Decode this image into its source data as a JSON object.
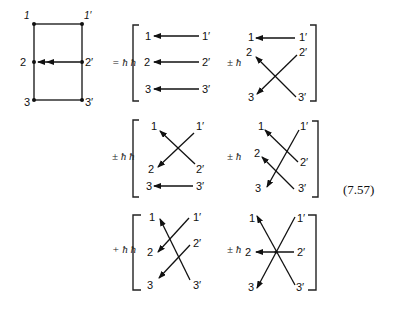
{
  "figure": {
    "equation_number": "(7.57)",
    "reference_diagram": {
      "labels": {
        "n1": "1",
        "n1p": "1′",
        "n2": "2",
        "n2p": "2′",
        "n3": "3",
        "n3p": "3′"
      },
      "description": "Rectangle with vertices 1,1',3,3' and midpoints 2,2'; double arrow from 2' to 2"
    },
    "terms": [
      {
        "coef": "= ħ ħ",
        "arrows": [
          "1'→1",
          "2'→2",
          "3'→3"
        ]
      },
      {
        "coef": "± ħ",
        "arrows": [
          "1'→1",
          "3'→2",
          "2'→3"
        ]
      },
      {
        "coef": "± ħ ħ",
        "arrows": [
          "2'→1",
          "1'→2",
          "3'→3"
        ]
      },
      {
        "coef": "± ħ",
        "arrows": [
          "2'→1",
          "3'→2",
          "1'→3"
        ]
      },
      {
        "coef": "+ ħ ħ",
        "arrows": [
          "3'→1",
          "1'→2",
          "2'→3"
        ]
      },
      {
        "coef": "± ħ",
        "arrows": [
          "3'→1",
          "2'→2",
          "1'→3"
        ]
      }
    ],
    "node_labels": {
      "n1": "1",
      "n2": "2",
      "n3": "3",
      "n1p": "1′",
      "n2p": "2′",
      "n3p": "3′"
    }
  }
}
